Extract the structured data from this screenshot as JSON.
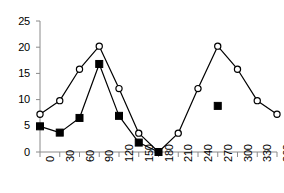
{
  "chart_data": {
    "type": "line",
    "title": "",
    "subtitle": "",
    "xlabel": "",
    "ylabel": "",
    "xlim": [
      0,
      360
    ],
    "ylim": [
      0,
      25
    ],
    "x": [
      0,
      30,
      60,
      90,
      120,
      150,
      180,
      210,
      240,
      270,
      300,
      330,
      360
    ],
    "xticks": [
      "0",
      "30",
      "60",
      "90",
      "120",
      "150",
      "180",
      "210",
      "240",
      "270",
      "300",
      "330",
      "360"
    ],
    "yticks": [
      "0",
      "5",
      "10",
      "15",
      "20",
      "25"
    ],
    "ytick_values": [
      0,
      5,
      10,
      15,
      20,
      25
    ],
    "grid": false,
    "legend": "none",
    "xtick_rotation": -90,
    "series": [
      {
        "name": "open-circle-series",
        "marker": "open-circle",
        "line": true,
        "color": "#000000",
        "fill": "#ffffff",
        "values": [
          7.2,
          9.8,
          15.8,
          20.2,
          12.1,
          3.6,
          0.0,
          3.6,
          12.1,
          20.2,
          15.8,
          9.8,
          7.2
        ]
      },
      {
        "name": "filled-square-series",
        "marker": "filled-square",
        "line": true,
        "color": "#000000",
        "fill": "#000000",
        "values": [
          4.9,
          3.7,
          6.5,
          16.8,
          6.9,
          1.8,
          0.0,
          null,
          null,
          8.8,
          null,
          null,
          null
        ]
      }
    ]
  },
  "axes": {
    "x_axis_name": "x-axis",
    "y_axis_name": "y-axis"
  }
}
